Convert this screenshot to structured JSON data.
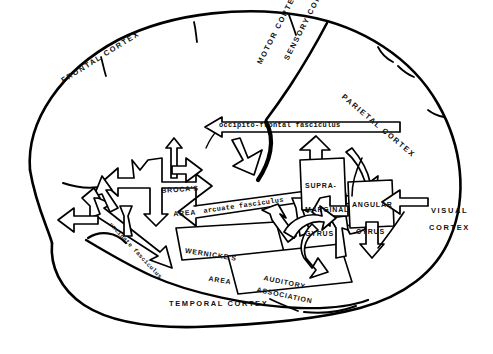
{
  "figure": {
    "type": "anatomical-diagram",
    "background_color": "#ffffff",
    "ink_color": "#000000"
  },
  "cortex_labels": [
    {
      "id": "frontal",
      "text": "FRONTAL CORTEX",
      "x": 60,
      "y": 78,
      "rotate": -32
    },
    {
      "id": "motor",
      "text": "MOTOR CORTEX",
      "x": 256,
      "y": 62,
      "rotate": -63
    },
    {
      "id": "sensory",
      "text": "SENSORY CORTEX",
      "x": 283,
      "y": 58,
      "rotate": -63
    },
    {
      "id": "parietal",
      "text": "PARIETAL CORTEX",
      "x": 345,
      "y": 93,
      "rotate": 40
    },
    {
      "id": "visual1",
      "text": "VISUAL",
      "x": 431,
      "y": 207,
      "rotate": 0
    },
    {
      "id": "visual2",
      "text": "CORTEX",
      "x": 429,
      "y": 224,
      "rotate": 0
    },
    {
      "id": "temporal",
      "text": "TEMPORAL CORTEX",
      "x": 169,
      "y": 300,
      "rotate": 0
    }
  ],
  "area_labels": [
    {
      "id": "brocas",
      "line1": "BROCA'S",
      "line2": "AREA",
      "x": 160,
      "y": 172,
      "rotate": -4
    },
    {
      "id": "wernickes",
      "line1": "WERNICKE'S",
      "line2": "AREA",
      "x": 230,
      "y": 237,
      "rotate": 9
    },
    {
      "id": "auditory",
      "line1": "AUDITORY",
      "line2": "ASSOCIATION",
      "x": 268,
      "y": 268,
      "rotate": 12
    },
    {
      "id": "supramarginal",
      "line1": "SUPRA-",
      "line2": "MARGINAL",
      "line3": "GYRUS",
      "x": 313,
      "y": 173,
      "rotate": 0
    },
    {
      "id": "angular",
      "line1": "ANGULAR",
      "line2": "GYRUS",
      "x": 363,
      "y": 188,
      "rotate": 0
    }
  ],
  "tract_labels": [
    {
      "id": "occipito-frontal",
      "text": "occipito-frontal fasciculus",
      "x": 219,
      "y": 129,
      "rotate": 0
    },
    {
      "id": "arcuate",
      "text": "arcuate fasciculus",
      "x": 203,
      "y": 208,
      "rotate": -8
    },
    {
      "id": "uncinate",
      "text": "uncinate fasciculus",
      "x": 112,
      "y": 224,
      "rotate": 47
    }
  ],
  "legend_terms": [
    "FRONTAL CORTEX",
    "MOTOR CORTEX",
    "SENSORY CORTEX",
    "PARIETAL CORTEX",
    "VISUAL CORTEX",
    "TEMPORAL CORTEX",
    "BROCA'S AREA",
    "WERNICKE'S AREA",
    "AUDITORY ASSOCIATION",
    "SUPRA-MARGINAL GYRUS",
    "ANGULAR GYRUS",
    "occipito-frontal fasciculus",
    "arcuate fasciculus",
    "uncinate fasciculus"
  ]
}
